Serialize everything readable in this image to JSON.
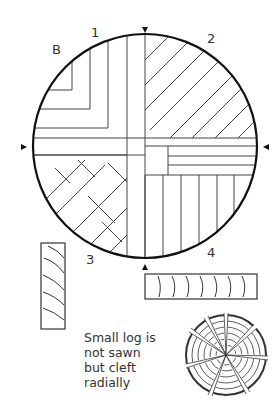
{
  "diagram": {
    "labels": {
      "b": "B",
      "q1": "1",
      "q2": "2",
      "q3": "3",
      "q4": "4"
    },
    "note": {
      "lines": [
        "Small log is",
        "not sawn",
        "but cleft",
        "radially"
      ]
    },
    "markers": [
      "top-arrow",
      "bottom-arrow",
      "left-arrow",
      "right-arrow"
    ],
    "colors": {
      "ink": "#222222",
      "background": "#ffffff"
    }
  }
}
